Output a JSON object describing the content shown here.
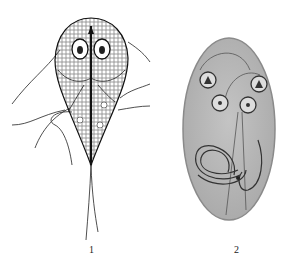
{
  "figure": {
    "panels": [
      {
        "label": "1",
        "subject": "trophozoite illustration (pear-shaped flagellate with two nuclei, axostyle and flagella)"
      },
      {
        "label": "2",
        "subject": "cyst illustration (oval cyst with four nuclei and curved internal fibrils)"
      }
    ],
    "colors": {
      "background": "#ffffff",
      "ink": "#1a1a1a",
      "cyst_fill": "#b8b8b8",
      "cyst_border": "#8a8a8a"
    }
  }
}
